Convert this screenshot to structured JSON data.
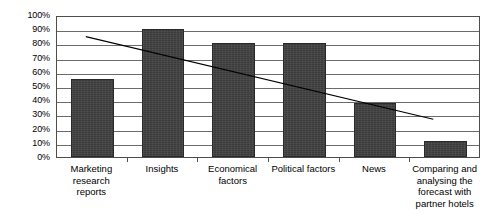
{
  "chart_data": {
    "type": "bar",
    "title": "",
    "subtitle": "",
    "xlabel": "",
    "ylabel": "",
    "categories": [
      "Marketing research reports",
      "Insights",
      "Economical factors",
      "Political factors",
      "News",
      "Comparing and analysing the forecast with partner hotels"
    ],
    "values": [
      55,
      90,
      80,
      80,
      38,
      11
    ],
    "ylim": [
      0,
      100
    ],
    "ytick_labels": [
      "100%",
      "90%",
      "80%",
      "70%",
      "60%",
      "50%",
      "40%",
      "30%",
      "20%",
      "10%",
      "0%"
    ],
    "ytick_values": [
      100,
      90,
      80,
      70,
      60,
      50,
      40,
      30,
      20,
      10,
      0
    ],
    "grid": true,
    "legend": "none",
    "series": [
      {
        "name": "Values",
        "type": "bar",
        "values": [
          55,
          90,
          80,
          80,
          38,
          11
        ],
        "color": "#3b3b3b"
      },
      {
        "name": "Trendline",
        "type": "line",
        "color": "#000000",
        "start_value": 86,
        "end_value": 27,
        "start_x": 0.41,
        "end_x": 5.35
      }
    ],
    "annotations": []
  },
  "axis": {
    "y_labels": [
      "100%",
      "90%",
      "80%",
      "70%",
      "60%",
      "50%",
      "40%",
      "30%",
      "20%",
      "10%",
      "0%"
    ],
    "x_labels": [
      "Marketing research reports",
      "Insights",
      "Economical factors",
      "Political factors",
      "News",
      "Comparing and analysing the forecast with partner hotels"
    ]
  },
  "colors": {
    "bar": "#3b3b3b",
    "bar_border": "#2a2a2a",
    "trendline": "#000000",
    "gridline": "#6b6b6b",
    "plot_border": "#4d4d4d",
    "background": "#ffffff",
    "text": "#000000"
  }
}
